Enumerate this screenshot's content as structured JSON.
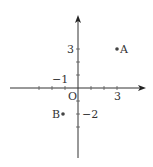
{
  "diagram": {
    "type": "coordinate-plane",
    "origin_label": "O",
    "x_tick_labels": [
      {
        "value": -1,
        "text": "−1"
      },
      {
        "value": 3,
        "text": "3"
      }
    ],
    "y_tick_labels": [
      {
        "value": 3,
        "text": "3"
      },
      {
        "value": -2,
        "text": "−2"
      }
    ],
    "points": [
      {
        "name": "A",
        "x": 3,
        "y": 3
      },
      {
        "name": "B",
        "x": -1.2,
        "y": -2
      }
    ],
    "colors": {
      "axis": "#333333",
      "point": "#444444",
      "background": "#ffffff"
    }
  }
}
